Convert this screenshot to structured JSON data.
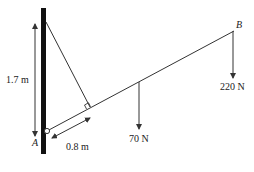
{
  "diagram": {
    "type": "statics-free-body",
    "labels": {
      "point_a": "A",
      "point_b": "B",
      "height": "1.7 m",
      "distance_along_rod": "0.8 m",
      "force_mid": "70 N",
      "force_end": "220 N"
    },
    "colors": {
      "wall": "#111111",
      "line": "#333333",
      "text": "#222222",
      "background": "#ffffff"
    }
  }
}
